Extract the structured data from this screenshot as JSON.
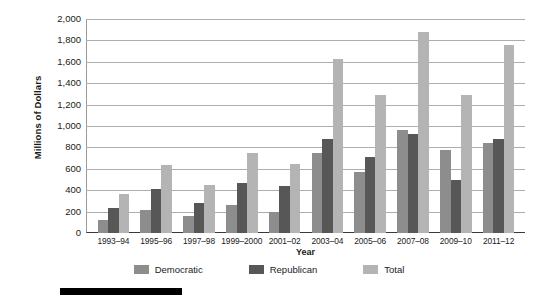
{
  "chart_data": {
    "type": "bar",
    "title": "",
    "xlabel": "Year",
    "ylabel": "Millions of Dollars",
    "ylim": [
      0,
      2000
    ],
    "ytick_step": 200,
    "grid": true,
    "legend_position": "bottom",
    "categories": [
      "1993–94",
      "1995–96",
      "1997–98",
      "1999–2000",
      "2001–02",
      "2003–04",
      "2005–06",
      "2007–08",
      "2009–10",
      "2011–12"
    ],
    "ytick_labels": [
      "0",
      "200",
      "400",
      "600",
      "800",
      "1,000",
      "1,200",
      "1,400",
      "1,600",
      "1,800",
      "2,000"
    ],
    "series": [
      {
        "name": "Democratic",
        "color": "#8d8d8d",
        "values": [
          125,
          215,
          160,
          265,
          200,
          750,
          570,
          960,
          775,
          845
        ]
      },
      {
        "name": "Republican",
        "color": "#575757",
        "values": [
          230,
          415,
          285,
          465,
          440,
          880,
          710,
          930,
          500,
          880
        ]
      },
      {
        "name": "Total",
        "color": "#b4b4b4",
        "values": [
          365,
          640,
          445,
          750,
          645,
          1625,
          1290,
          1880,
          1290,
          1760
        ]
      }
    ]
  }
}
